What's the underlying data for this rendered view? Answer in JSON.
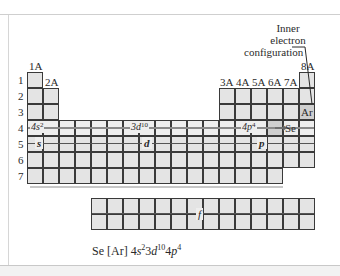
{
  "diagram": {
    "group_labels": {
      "g1": "1A",
      "g2": "2A",
      "g13": "3A",
      "g14": "4A",
      "g15": "5A",
      "g16": "6A",
      "g17": "7A",
      "g18": "8A"
    },
    "period_labels": [
      "1",
      "2",
      "3",
      "4",
      "5",
      "6",
      "7"
    ],
    "annotation": {
      "line1": "Inner",
      "line2": "electron",
      "line3": "configuration"
    },
    "blocks": {
      "s": "s",
      "d": "d",
      "p": "p",
      "f": "f"
    },
    "row4_labels": {
      "s": {
        "base": "4s",
        "sup": "2"
      },
      "d": {
        "base": "3d",
        "sup": "10"
      },
      "p": {
        "base": "4p",
        "sup": "4"
      }
    },
    "elements": {
      "ar": "Ar",
      "se": "Se"
    },
    "caption": {
      "symbol": "Se",
      "core": "[Ar]",
      "terms": [
        {
          "n": "4",
          "l": "s",
          "e": "2"
        },
        {
          "n": "3",
          "l": "d",
          "e": "10"
        },
        {
          "n": "4",
          "l": "p",
          "e": "4"
        }
      ]
    },
    "colors": {
      "cell": "#e4e4e4",
      "highlight_row": "#eeeeee",
      "element_cell": "#cfcfcf",
      "grid_line": "#3a3a3a"
    }
  }
}
